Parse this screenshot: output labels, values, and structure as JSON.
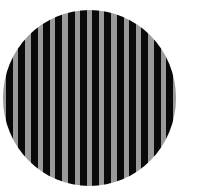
{
  "image": {
    "subject": "circular vertical grating",
    "shape": "circle",
    "stripe_orientation": "vertical",
    "stripe_period_px": 12.3,
    "colors": {
      "background": "#ffffff",
      "dark_stripe": "#0a0a0a",
      "light_stripe": "#9a9a9a"
    },
    "circle": {
      "center_x": 89,
      "center_y": 98,
      "radius_x": 86,
      "radius_y": 88
    }
  }
}
